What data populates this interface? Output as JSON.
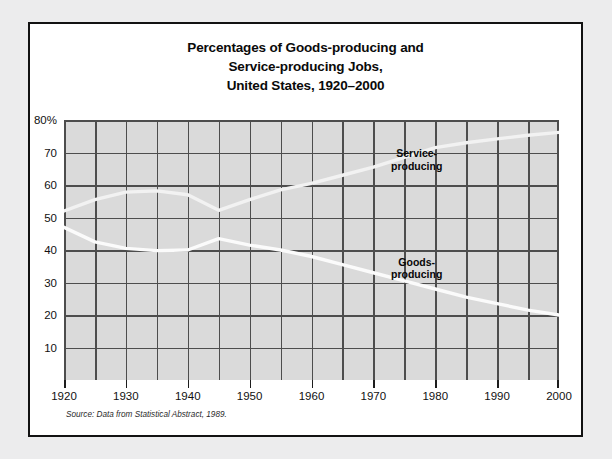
{
  "figure": {
    "title_lines": [
      "Percentages of Goods-producing and",
      "Service-producing Jobs,",
      "United States, 1920–2000"
    ],
    "source_prefix": "Source: Data from ",
    "source_work": "Statistical Abstract",
    "source_suffix": ", 1989."
  },
  "chart_data": {
    "type": "line",
    "title": "Percentages of Goods-producing and Service-producing Jobs, United States, 1920–2000",
    "xlabel": "",
    "ylabel": "",
    "xlim": [
      1920,
      2000
    ],
    "ylim": [
      0,
      80
    ],
    "grid": true,
    "x_major_ticks": [
      1920,
      1930,
      1940,
      1950,
      1960,
      1970,
      1980,
      1990,
      2000
    ],
    "x_minor_step": 5,
    "y_ticks": [
      80,
      70,
      60,
      50,
      40,
      30,
      20,
      10
    ],
    "y_tick_labels": [
      "80%",
      "70",
      "60",
      "50",
      "40",
      "30",
      "20",
      "10"
    ],
    "legend_position": "inline-annotations",
    "series": [
      {
        "name": "Service-producing",
        "color": "#f2f2f2",
        "label_position": {
          "x": 1977,
          "y": 68
        },
        "x": [
          1920,
          1925,
          1930,
          1935,
          1940,
          1945,
          1950,
          1955,
          1960,
          1965,
          1970,
          1975,
          1980,
          1985,
          1990,
          1995,
          2000
        ],
        "values": [
          52,
          55.5,
          57.8,
          58.2,
          57,
          52.2,
          55.5,
          58.5,
          60.5,
          63,
          65.5,
          68.5,
          71.5,
          73,
          74.2,
          75.3,
          76.2
        ]
      },
      {
        "name": "Goods-producing",
        "color": "#fbfbfb",
        "label_position": {
          "x": 1977,
          "y": 34.5
        },
        "x": [
          1920,
          1925,
          1930,
          1935,
          1940,
          1945,
          1950,
          1955,
          1960,
          1965,
          1970,
          1975,
          1980,
          1985,
          1990,
          1995,
          2000
        ],
        "values": [
          47,
          42.5,
          40.5,
          39.8,
          40,
          43.5,
          41.5,
          40,
          38,
          35.5,
          33,
          30.5,
          28,
          25.5,
          23.5,
          21.5,
          20
        ]
      }
    ]
  }
}
